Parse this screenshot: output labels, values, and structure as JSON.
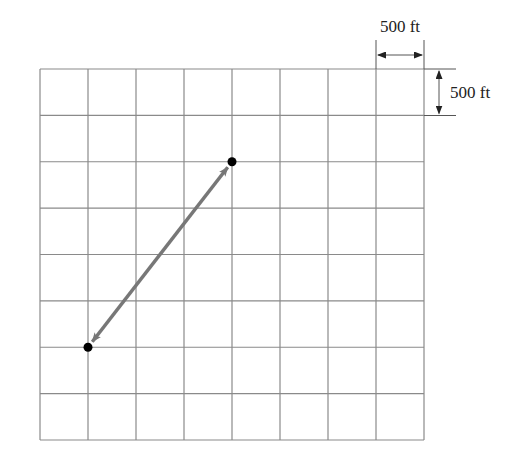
{
  "diagram": {
    "type": "grid-displacement",
    "grid": {
      "columns": 8,
      "rows": 8
    },
    "scale": {
      "horizontal_label": "500 ft",
      "vertical_label": "500 ft"
    },
    "points": [
      {
        "name": "start",
        "col": 4,
        "row": 2
      },
      {
        "name": "end",
        "col": 1,
        "row": 6
      }
    ],
    "vector": {
      "from": "start",
      "to": "end",
      "double_headed": true,
      "color": "#777777"
    },
    "colors": {
      "grid": "#8a8a8a",
      "point": "#000000"
    }
  }
}
